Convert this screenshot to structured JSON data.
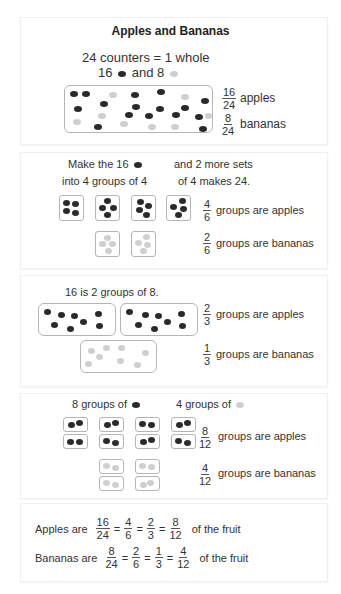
{
  "title": "Apples and Bananas",
  "colors": {
    "apple": "#2a2a2a",
    "banana": "#cfcfcf",
    "border": "#b5b5b5",
    "text": "#333333"
  },
  "panel1": {
    "line1": "24 counters = 1 whole",
    "line2_a": "16",
    "line2_b": "and 8",
    "apple_icon": "dark-counter-icon",
    "banana_icon": "light-counter-icon",
    "apples_frac": {
      "num": "16",
      "den": "24",
      "label": "apples"
    },
    "bananas_frac": {
      "num": "8",
      "den": "24",
      "label": "bananas"
    },
    "counters_total": 24,
    "apples_count": 16,
    "bananas_count": 8
  },
  "panel2": {
    "left_line1": "Make the 16",
    "left_line2": "into 4 groups of 4",
    "right_line1": "and 2 more sets",
    "right_line2": "of 4 makes 24.",
    "apples_frac": {
      "num": "4",
      "den": "6",
      "label": "groups are apples"
    },
    "bananas_frac": {
      "num": "2",
      "den": "6",
      "label": "groups are bananas"
    }
  },
  "panel3": {
    "line1": "16 is 2 groups of 8.",
    "apples_frac": {
      "num": "2",
      "den": "3",
      "label": "groups are apples"
    },
    "bananas_frac": {
      "num": "1",
      "den": "3",
      "label": "groups are bananas"
    }
  },
  "panel4": {
    "left_line": "8 groups of",
    "right_line": "4 groups of",
    "apples_frac": {
      "num": "8",
      "den": "12",
      "label": "groups are apples"
    },
    "bananas_frac": {
      "num": "4",
      "den": "12",
      "label": "groups are bananas"
    }
  },
  "panel5": {
    "apples": {
      "prefix": "Apples are",
      "fracs": [
        {
          "num": "16",
          "den": "24"
        },
        {
          "num": "4",
          "den": "6"
        },
        {
          "num": "2",
          "den": "3"
        },
        {
          "num": "8",
          "den": "12"
        }
      ],
      "eq": "=",
      "suffix": "of the fruit"
    },
    "bananas": {
      "prefix": "Bananas are",
      "fracs": [
        {
          "num": "8",
          "den": "24"
        },
        {
          "num": "2",
          "den": "6"
        },
        {
          "num": "1",
          "den": "3"
        },
        {
          "num": "4",
          "den": "12"
        }
      ],
      "eq": "=",
      "suffix": "of the fruit"
    }
  }
}
